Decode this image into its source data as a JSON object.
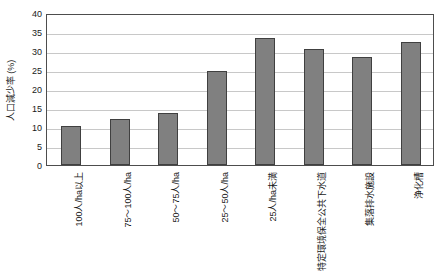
{
  "chart_data": {
    "type": "bar",
    "title": "",
    "xlabel": "",
    "ylabel": "人口減少率 (%)",
    "ylim": [
      0,
      40
    ],
    "y_ticks": [
      0,
      5,
      10,
      15,
      20,
      25,
      30,
      35,
      40
    ],
    "grid": true,
    "legend": "none",
    "bar_color": "#808080",
    "bar_edge_color": "#404040",
    "plot_border_color": "#4d4d4d",
    "gridline_color": "#c8c8c8",
    "categories": [
      "100人/ha以上",
      "75～100人/ha",
      "50～75人/ha",
      "25～50人/ha",
      "25人/ha未満",
      "特定環境保全公共下水道",
      "集落排水施設",
      "浄化槽"
    ],
    "values": [
      10.3,
      12.0,
      13.7,
      24.8,
      33.5,
      30.5,
      28.3,
      32.5
    ]
  }
}
